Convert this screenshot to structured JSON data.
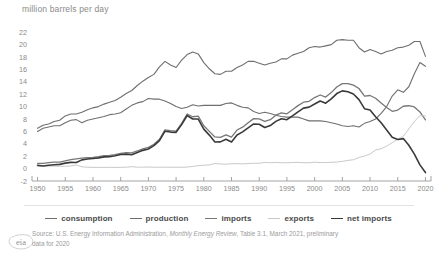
{
  "chart_data": {
    "type": "line",
    "title": "million barrels per day",
    "xlabel": "",
    "ylabel": "million barrels per day",
    "xlim": [
      1949,
      2021
    ],
    "ylim": [
      -2,
      23
    ],
    "ytick_step": 2,
    "grid": false,
    "legend_position": "bottom",
    "xticks": [
      "1950",
      "1955",
      "1960",
      "1965",
      "1970",
      "1975",
      "1980",
      "1985",
      "1990",
      "1995",
      "2000",
      "2005",
      "2010",
      "2015",
      "2020"
    ],
    "yticks": [
      "-2",
      "0",
      "2",
      "4",
      "6",
      "8",
      "10",
      "12",
      "14",
      "16",
      "18",
      "20",
      "22"
    ],
    "x": [
      1950,
      1951,
      1952,
      1953,
      1954,
      1955,
      1956,
      1957,
      1958,
      1959,
      1960,
      1961,
      1962,
      1963,
      1964,
      1965,
      1966,
      1967,
      1968,
      1969,
      1970,
      1971,
      1972,
      1973,
      1974,
      1975,
      1976,
      1977,
      1978,
      1979,
      1980,
      1981,
      1982,
      1983,
      1984,
      1985,
      1986,
      1987,
      1988,
      1989,
      1990,
      1991,
      1992,
      1993,
      1994,
      1995,
      1996,
      1997,
      1998,
      1999,
      2000,
      2001,
      2002,
      2003,
      2004,
      2005,
      2006,
      2007,
      2008,
      2009,
      2010,
      2011,
      2012,
      2013,
      2014,
      2015,
      2016,
      2017,
      2018,
      2019,
      2020
    ],
    "series": [
      {
        "name": "consumption",
        "color": "#6f6f6f",
        "width": 1.1,
        "values": [
          6.5,
          7.0,
          7.2,
          7.6,
          7.8,
          8.5,
          8.8,
          8.8,
          9.1,
          9.5,
          9.8,
          10.0,
          10.4,
          10.7,
          11.0,
          11.5,
          12.1,
          12.6,
          13.4,
          14.1,
          14.7,
          15.2,
          16.4,
          17.3,
          16.7,
          16.3,
          17.5,
          18.4,
          18.8,
          18.5,
          17.1,
          16.1,
          15.3,
          15.2,
          15.7,
          15.7,
          16.3,
          16.7,
          17.3,
          17.3,
          17.0,
          16.7,
          17.0,
          17.2,
          17.7,
          17.7,
          18.3,
          18.6,
          18.9,
          19.5,
          19.7,
          19.6,
          19.8,
          20.0,
          20.7,
          20.8,
          20.7,
          20.7,
          19.5,
          18.8,
          19.2,
          18.9,
          18.5,
          18.9,
          19.1,
          19.5,
          19.6,
          19.9,
          20.5,
          20.5,
          18.1
        ]
      },
      {
        "name": "production",
        "color": "#6f6f6f",
        "width": 1.1,
        "values": [
          6.0,
          6.5,
          6.7,
          6.9,
          6.9,
          7.4,
          7.8,
          7.9,
          7.4,
          7.8,
          8.0,
          8.2,
          8.4,
          8.7,
          8.8,
          9.0,
          9.6,
          10.2,
          10.6,
          10.8,
          11.3,
          11.2,
          11.2,
          10.9,
          10.5,
          10.0,
          9.7,
          9.9,
          10.3,
          10.1,
          10.2,
          10.2,
          10.2,
          10.2,
          10.5,
          10.6,
          10.2,
          9.9,
          9.8,
          9.2,
          8.9,
          9.1,
          8.9,
          8.6,
          8.4,
          8.3,
          8.3,
          8.3,
          8.0,
          7.7,
          7.7,
          7.7,
          7.6,
          7.4,
          7.2,
          6.9,
          6.8,
          6.9,
          6.7,
          7.3,
          7.6,
          8.0,
          8.9,
          10.0,
          11.7,
          12.7,
          12.3,
          13.2,
          15.3,
          17.1,
          16.5
        ]
      },
      {
        "name": "imports",
        "color": "#777777",
        "width": 1.3,
        "values": [
          0.85,
          0.84,
          0.95,
          1.03,
          1.05,
          1.25,
          1.44,
          1.57,
          1.7,
          1.78,
          1.82,
          1.92,
          2.08,
          2.12,
          2.26,
          2.47,
          2.57,
          2.54,
          2.84,
          3.17,
          3.42,
          3.93,
          4.74,
          6.26,
          6.11,
          6.06,
          7.31,
          8.81,
          8.36,
          8.46,
          6.91,
          6.0,
          5.11,
          5.05,
          5.44,
          5.07,
          6.22,
          6.68,
          7.4,
          8.06,
          8.02,
          7.63,
          7.89,
          8.62,
          8.99,
          8.84,
          9.48,
          10.16,
          10.71,
          10.85,
          11.46,
          11.87,
          11.53,
          12.26,
          13.15,
          13.71,
          13.71,
          13.47,
          12.92,
          11.69,
          11.79,
          11.35,
          10.6,
          9.86,
          9.24,
          9.44,
          10.06,
          10.14,
          9.94,
          9.14,
          7.86
        ]
      },
      {
        "name": "exports",
        "color": "#c9c9c9",
        "width": 1.0,
        "values": [
          0.31,
          0.42,
          0.4,
          0.4,
          0.37,
          0.37,
          0.43,
          0.58,
          0.29,
          0.22,
          0.2,
          0.19,
          0.19,
          0.21,
          0.2,
          0.19,
          0.23,
          0.31,
          0.23,
          0.23,
          0.26,
          0.22,
          0.22,
          0.23,
          0.22,
          0.21,
          0.22,
          0.24,
          0.36,
          0.47,
          0.54,
          0.6,
          0.82,
          0.74,
          0.72,
          0.78,
          0.79,
          0.76,
          0.82,
          0.86,
          0.86,
          1.0,
          0.95,
          1.0,
          0.94,
          0.95,
          0.98,
          1.0,
          0.95,
          0.94,
          1.04,
          0.97,
          0.98,
          1.01,
          1.05,
          1.17,
          1.32,
          1.43,
          1.8,
          2.02,
          2.35,
          2.99,
          3.21,
          3.62,
          4.18,
          4.74,
          5.22,
          6.38,
          7.6,
          8.54,
          8.51
        ]
      },
      {
        "name": "net imports",
        "color": "#3a3a3a",
        "width": 1.6,
        "values": [
          0.54,
          0.42,
          0.55,
          0.63,
          0.68,
          0.88,
          1.01,
          0.99,
          1.41,
          1.56,
          1.62,
          1.73,
          1.89,
          1.91,
          2.06,
          2.28,
          2.34,
          2.23,
          2.61,
          2.94,
          3.16,
          3.71,
          4.52,
          6.03,
          5.89,
          5.85,
          7.09,
          8.57,
          8.0,
          7.99,
          6.37,
          5.4,
          4.29,
          4.31,
          4.72,
          4.29,
          5.43,
          5.92,
          6.58,
          7.2,
          7.16,
          6.63,
          6.94,
          7.62,
          8.05,
          7.89,
          8.5,
          9.16,
          9.76,
          9.91,
          10.42,
          10.9,
          10.55,
          11.25,
          12.1,
          12.54,
          12.39,
          12.04,
          11.12,
          9.67,
          9.44,
          8.36,
          7.39,
          6.24,
          5.06,
          4.7,
          4.84,
          3.76,
          2.34,
          0.6,
          -0.64
        ]
      }
    ],
    "legend": [
      {
        "label": "consumption",
        "color": "#6f6f6f"
      },
      {
        "label": "production",
        "color": "#6f6f6f"
      },
      {
        "label": "imports",
        "color": "#777777"
      },
      {
        "label": "exports",
        "color": "#c9c9c9"
      },
      {
        "label": "net imports",
        "color": "#3a3a3a"
      }
    ]
  },
  "source": {
    "line1_pre": "Source: U.S. Energy Information Administration, ",
    "line1_em": "Monthly Energy Review",
    "line1_post": ", Table 3.1, March 2021, preliminary",
    "line2": "data for 2020"
  },
  "logo": {
    "text": "eia"
  }
}
